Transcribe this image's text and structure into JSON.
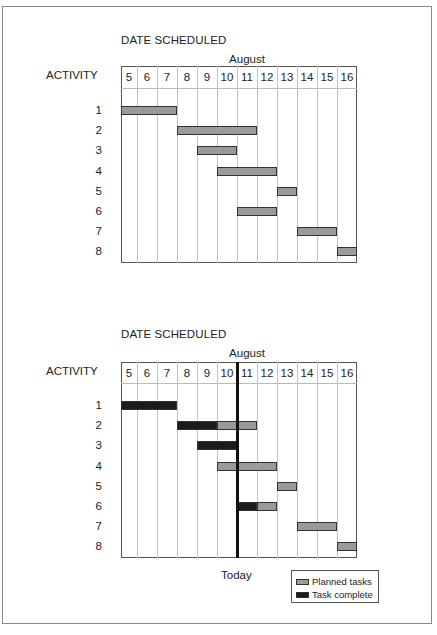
{
  "chart_data": [
    {
      "type": "gantt",
      "title": "DATE SCHEDULED",
      "month_label": "August",
      "ylabel": "ACTIVITY",
      "days": [
        "5",
        "6",
        "7",
        "8",
        "9",
        "10",
        "11",
        "12",
        "13",
        "14",
        "15",
        "16"
      ],
      "activities": [
        "1",
        "2",
        "3",
        "4",
        "5",
        "6",
        "7",
        "8"
      ],
      "tasks": [
        {
          "activity": "1",
          "planned": [
            5,
            7
          ]
        },
        {
          "activity": "2",
          "planned": [
            8,
            11
          ]
        },
        {
          "activity": "3",
          "planned": [
            9,
            10
          ]
        },
        {
          "activity": "4",
          "planned": [
            10,
            12
          ]
        },
        {
          "activity": "5",
          "planned": [
            13,
            13
          ]
        },
        {
          "activity": "6",
          "planned": [
            11,
            12
          ]
        },
        {
          "activity": "7",
          "planned": [
            14,
            15
          ]
        },
        {
          "activity": "8",
          "planned": [
            16,
            16
          ]
        }
      ],
      "grid": true
    },
    {
      "type": "gantt",
      "title": "DATE SCHEDULED",
      "month_label": "August",
      "ylabel": "ACTIVITY",
      "days": [
        "5",
        "6",
        "7",
        "8",
        "9",
        "10",
        "11",
        "12",
        "13",
        "14",
        "15",
        "16"
      ],
      "activities": [
        "1",
        "2",
        "3",
        "4",
        "5",
        "6",
        "7",
        "8"
      ],
      "today_marker": {
        "label": "Today",
        "between_days": [
          "10",
          "11"
        ]
      },
      "tasks": [
        {
          "activity": "1",
          "complete": [
            5,
            7
          ],
          "planned": null
        },
        {
          "activity": "2",
          "complete": [
            8,
            9
          ],
          "planned": [
            10,
            11
          ]
        },
        {
          "activity": "3",
          "complete": [
            9,
            10
          ],
          "planned": null
        },
        {
          "activity": "4",
          "complete": null,
          "planned": [
            10,
            12
          ]
        },
        {
          "activity": "5",
          "complete": null,
          "planned": [
            13,
            13
          ]
        },
        {
          "activity": "6",
          "complete": [
            11,
            11
          ],
          "planned": [
            12,
            12
          ]
        },
        {
          "activity": "7",
          "complete": null,
          "planned": [
            14,
            15
          ]
        },
        {
          "activity": "8",
          "complete": null,
          "planned": [
            16,
            16
          ]
        }
      ],
      "legend": [
        {
          "label": "Planned tasks",
          "color": "#9a9a9a"
        },
        {
          "label": "Task complete",
          "color": "#1b1b1b"
        }
      ],
      "legend_position": "bottom-right",
      "grid": true
    }
  ],
  "charts": [
    {
      "title": "DATE SCHEDULED",
      "month": "August",
      "activity_label": "ACTIVITY",
      "days": [
        "5",
        "6",
        "7",
        "8",
        "9",
        "10",
        "11",
        "12",
        "13",
        "14",
        "15",
        "16"
      ],
      "rows": [
        "1",
        "2",
        "3",
        "4",
        "5",
        "6",
        "7",
        "8"
      ],
      "bars": [
        {
          "row": 0,
          "start": 0,
          "end": 3,
          "kind": "planned"
        },
        {
          "row": 1,
          "start": 3,
          "end": 7,
          "kind": "planned"
        },
        {
          "row": 2,
          "start": 4,
          "end": 6,
          "kind": "planned"
        },
        {
          "row": 3,
          "start": 5,
          "end": 8,
          "kind": "planned"
        },
        {
          "row": 4,
          "start": 8,
          "end": 9,
          "kind": "planned"
        },
        {
          "row": 5,
          "start": 6,
          "end": 8,
          "kind": "planned"
        },
        {
          "row": 6,
          "start": 9,
          "end": 11,
          "kind": "planned"
        },
        {
          "row": 7,
          "start": 11,
          "end": 12,
          "kind": "planned"
        }
      ]
    },
    {
      "title": "DATE SCHEDULED",
      "month": "August",
      "activity_label": "ACTIVITY",
      "days": [
        "5",
        "6",
        "7",
        "8",
        "9",
        "10",
        "11",
        "12",
        "13",
        "14",
        "15",
        "16"
      ],
      "rows": [
        "1",
        "2",
        "3",
        "4",
        "5",
        "6",
        "7",
        "8"
      ],
      "bars": [
        {
          "row": 0,
          "start": 0,
          "end": 3,
          "kind": "complete"
        },
        {
          "row": 1,
          "start": 3,
          "end": 5,
          "kind": "complete"
        },
        {
          "row": 1,
          "start": 5,
          "end": 7,
          "kind": "planned"
        },
        {
          "row": 2,
          "start": 4,
          "end": 6,
          "kind": "complete"
        },
        {
          "row": 3,
          "start": 5,
          "end": 8,
          "kind": "planned"
        },
        {
          "row": 4,
          "start": 8,
          "end": 9,
          "kind": "planned"
        },
        {
          "row": 5,
          "start": 6,
          "end": 7,
          "kind": "complete"
        },
        {
          "row": 5,
          "start": 7,
          "end": 8,
          "kind": "planned"
        },
        {
          "row": 6,
          "start": 9,
          "end": 11,
          "kind": "planned"
        },
        {
          "row": 7,
          "start": 11,
          "end": 12,
          "kind": "planned"
        }
      ],
      "today_label": "Today",
      "today_col": 6,
      "legend": {
        "planned": "Planned tasks",
        "complete": "Task complete"
      }
    }
  ],
  "colors": {
    "planned": "#9a9a9a",
    "complete": "#1b1b1b",
    "grid": "#c4c4c4",
    "frame": "#8a8a8a"
  }
}
